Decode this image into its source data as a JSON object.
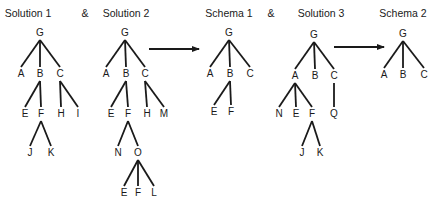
{
  "titles": [
    {
      "id": "solution-1",
      "label": "Solution 1",
      "x": 28,
      "y": 14
    },
    {
      "id": "solution-2",
      "label": "Solution 2",
      "x": 126,
      "y": 14
    },
    {
      "id": "schema-1",
      "label": "Schema 1",
      "x": 229,
      "y": 14
    },
    {
      "id": "solution-3",
      "label": "Solution 3",
      "x": 321,
      "y": 14
    },
    {
      "id": "schema-2",
      "label": "Schema 2",
      "x": 403,
      "y": 14
    }
  ],
  "ampersands": [
    {
      "label": "&",
      "x": 85,
      "y": 14
    },
    {
      "label": "&",
      "x": 271,
      "y": 14
    }
  ],
  "trees": [
    {
      "name": "solution-1",
      "nodes": [
        {
          "label": "G",
          "x": 40,
          "y": 33
        },
        {
          "label": "A",
          "x": 21,
          "y": 74
        },
        {
          "label": "B",
          "x": 40,
          "y": 74
        },
        {
          "label": "C",
          "x": 60,
          "y": 74
        },
        {
          "label": "E",
          "x": 25,
          "y": 114
        },
        {
          "label": "F",
          "x": 41,
          "y": 114
        },
        {
          "label": "H",
          "x": 61,
          "y": 114
        },
        {
          "label": "I",
          "x": 78,
          "y": 114
        },
        {
          "label": "J",
          "x": 30,
          "y": 153
        },
        {
          "label": "K",
          "x": 51,
          "y": 153
        }
      ],
      "edges": [
        [
          0,
          1
        ],
        [
          0,
          2
        ],
        [
          0,
          3
        ],
        [
          2,
          4
        ],
        [
          2,
          5
        ],
        [
          3,
          6
        ],
        [
          3,
          7
        ],
        [
          5,
          8
        ],
        [
          5,
          9
        ]
      ]
    },
    {
      "name": "solution-2",
      "nodes": [
        {
          "label": "G",
          "x": 125,
          "y": 33
        },
        {
          "label": "A",
          "x": 106,
          "y": 74
        },
        {
          "label": "B",
          "x": 126,
          "y": 74
        },
        {
          "label": "C",
          "x": 145,
          "y": 74
        },
        {
          "label": "E",
          "x": 111,
          "y": 114
        },
        {
          "label": "F",
          "x": 128,
          "y": 114
        },
        {
          "label": "H",
          "x": 147,
          "y": 114
        },
        {
          "label": "M",
          "x": 164,
          "y": 114
        },
        {
          "label": "N",
          "x": 118,
          "y": 153
        },
        {
          "label": "O",
          "x": 138,
          "y": 153
        },
        {
          "label": "E",
          "x": 124,
          "y": 193
        },
        {
          "label": "F",
          "x": 138,
          "y": 193
        },
        {
          "label": "L",
          "x": 154,
          "y": 193
        }
      ],
      "edges": [
        [
          0,
          1
        ],
        [
          0,
          2
        ],
        [
          0,
          3
        ],
        [
          2,
          4
        ],
        [
          2,
          5
        ],
        [
          3,
          6
        ],
        [
          3,
          7
        ],
        [
          5,
          8
        ],
        [
          5,
          9
        ],
        [
          9,
          10
        ],
        [
          9,
          11
        ],
        [
          9,
          12
        ]
      ]
    },
    {
      "name": "schema-1",
      "nodes": [
        {
          "label": "G",
          "x": 229,
          "y": 33
        },
        {
          "label": "A",
          "x": 210,
          "y": 74
        },
        {
          "label": "B",
          "x": 230,
          "y": 74
        },
        {
          "label": "C",
          "x": 250,
          "y": 74
        },
        {
          "label": "E",
          "x": 214,
          "y": 112
        },
        {
          "label": "F",
          "x": 231,
          "y": 112
        }
      ],
      "edges": [
        [
          0,
          1
        ],
        [
          0,
          2
        ],
        [
          0,
          3
        ],
        [
          2,
          4
        ],
        [
          2,
          5
        ]
      ]
    },
    {
      "name": "solution-3",
      "nodes": [
        {
          "label": "G",
          "x": 314,
          "y": 35
        },
        {
          "label": "A",
          "x": 295,
          "y": 76
        },
        {
          "label": "B",
          "x": 315,
          "y": 76
        },
        {
          "label": "C",
          "x": 334,
          "y": 76
        },
        {
          "label": "N",
          "x": 279,
          "y": 114
        },
        {
          "label": "E",
          "x": 296,
          "y": 114
        },
        {
          "label": "F",
          "x": 312,
          "y": 114
        },
        {
          "label": "Q",
          "x": 334,
          "y": 114
        },
        {
          "label": "J",
          "x": 302,
          "y": 153
        },
        {
          "label": "K",
          "x": 320,
          "y": 153
        }
      ],
      "edges": [
        [
          0,
          1
        ],
        [
          0,
          2
        ],
        [
          0,
          3
        ],
        [
          1,
          4
        ],
        [
          1,
          5
        ],
        [
          1,
          6
        ],
        [
          3,
          7
        ],
        [
          6,
          8
        ],
        [
          6,
          9
        ]
      ]
    },
    {
      "name": "schema-2",
      "nodes": [
        {
          "label": "G",
          "x": 403,
          "y": 34
        },
        {
          "label": "A",
          "x": 384,
          "y": 75
        },
        {
          "label": "B",
          "x": 403,
          "y": 75
        },
        {
          "label": "C",
          "x": 424,
          "y": 75
        }
      ],
      "edges": [
        [
          0,
          1
        ],
        [
          0,
          2
        ],
        [
          0,
          3
        ]
      ]
    }
  ],
  "arrows": [
    {
      "x1": 149,
      "y1": 49,
      "x2": 199,
      "y2": 49
    },
    {
      "x1": 334,
      "y1": 47,
      "x2": 384,
      "y2": 47
    }
  ],
  "colors": {
    "ink": "#1a1a1a",
    "background": "#ffffff"
  }
}
